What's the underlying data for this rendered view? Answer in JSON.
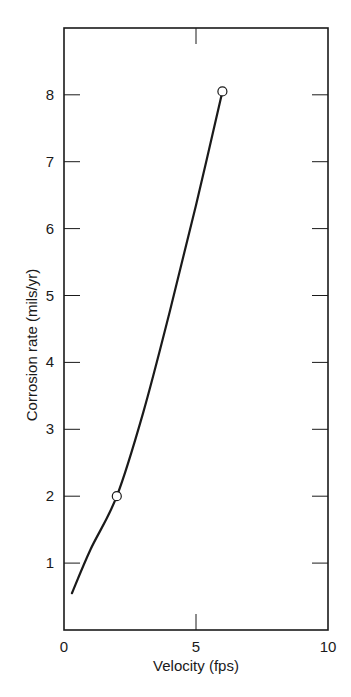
{
  "chart_data": {
    "type": "line",
    "title": "",
    "xlabel": "Velocity (fps)",
    "ylabel": "Corrosion rate (mils/yr)",
    "xlim": [
      0,
      10
    ],
    "ylim": [
      0,
      9
    ],
    "x_ticks": [
      0,
      5,
      10
    ],
    "x_tick_labels": [
      "0",
      "5",
      "10"
    ],
    "y_ticks": [
      1,
      2,
      3,
      4,
      5,
      6,
      7,
      8
    ],
    "y_tick_labels": [
      "1",
      "2",
      "3",
      "4",
      "5",
      "6",
      "7",
      "8"
    ],
    "grid": false,
    "legend": null,
    "series": [
      {
        "name": "Corrosion rate vs velocity",
        "curve": {
          "x": [
            0.3,
            1.0,
            2.0,
            3.0,
            4.0,
            5.0,
            6.0
          ],
          "y": [
            0.55,
            1.2,
            2.0,
            3.25,
            4.75,
            6.35,
            8.05
          ]
        },
        "markers": {
          "style": "open-circle",
          "x": [
            2.0,
            6.0
          ],
          "y": [
            2.0,
            8.05
          ]
        }
      }
    ]
  },
  "plot": {
    "frame": {
      "left": 64,
      "right": 328,
      "top": 28,
      "bottom": 630
    },
    "x_px_per_unit": 26.4,
    "y_zero_px": 630,
    "y_px_per_unit": 66.9,
    "line_color": "#1a1a1a",
    "background": "#ffffff"
  }
}
